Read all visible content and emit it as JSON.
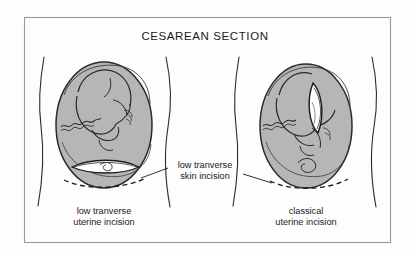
{
  "figure": {
    "title": "CESAREAN SECTION",
    "frame_color": "#9a9a9a",
    "background_color": "#fdfdfd",
    "ink_color": "#1a1a1a",
    "uterus_fill_color": "#b6b6b6",
    "incision_open_color": "#ffffff"
  },
  "callout": {
    "line1": "low tranverse",
    "line2": "skin incision",
    "name": "low-transverse-skin-incision"
  },
  "panels": [
    {
      "id": "left-panel",
      "name": "low-transverse-uterine-incision-panel",
      "caption_line1": "low tranverse",
      "caption_line2": "uterine incision",
      "incision_type": "transverse",
      "incision_orientation": "horizontal",
      "fetal_presentation": "cephalic",
      "dashed_line": "skin incision line"
    },
    {
      "id": "right-panel",
      "name": "classical-uterine-incision-panel",
      "caption_line1": "classical",
      "caption_line2": "uterine incision",
      "incision_type": "classical",
      "incision_orientation": "vertical",
      "fetal_presentation": "cephalic",
      "dashed_line": "skin incision line"
    }
  ]
}
